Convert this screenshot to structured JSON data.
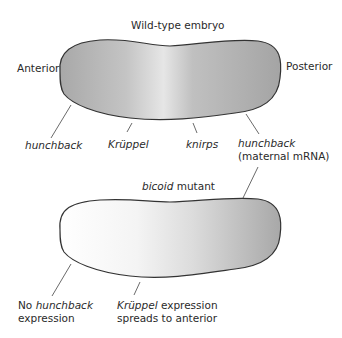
{
  "wildtype": {
    "title": "Wild-type embryo",
    "anterior_label": "Anterior",
    "posterior_label": "Posterior",
    "genes": [
      {
        "name": "hunchback",
        "note": ""
      },
      {
        "name": "Krüppel",
        "note": ""
      },
      {
        "name": "knirps",
        "note": ""
      },
      {
        "name": "hunchback",
        "note": "(maternal mRNA)"
      }
    ],
    "gradient": {
      "anterior": "#a9a9a9",
      "middle": "#e3e3e3",
      "posterior": "#a6a6a6"
    }
  },
  "mutant": {
    "title_italic": "bicoid",
    "title_rest": " mutant",
    "annotations": [
      {
        "italic_prefix": "",
        "line1_prefix": "No ",
        "line1_italic": "hunchback",
        "line2": "expression"
      },
      {
        "line1_italic": "Krüppel",
        "line1_rest": " expression",
        "line2": "spreads to anterior"
      }
    ],
    "gradient": {
      "anterior": "#ffffff",
      "middle": "#ececec",
      "posterior": "#a9a9a9"
    }
  }
}
